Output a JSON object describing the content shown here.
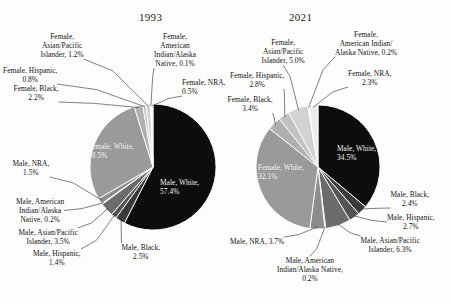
{
  "figure": {
    "background": "#fdfdfd",
    "text_color": "#141414"
  },
  "charts": [
    {
      "id": "chart-1993",
      "title": "1993",
      "center": {
        "x": 153,
        "y": 167
      },
      "radius": 63,
      "chart_data": {
        "type": "pie",
        "title": "1993",
        "start_angle_deg": -90,
        "direction": "clockwise",
        "categories": [
          "Male, White",
          "Male, Black",
          "Male, Hispanic",
          "Male, Asian/Pacific Islander",
          "Male, American Indian/Alaska Native",
          "Male, NRA",
          "Female, White",
          "Female, Black",
          "Female, Hispanic",
          "Female, Asian/Pacific Islander",
          "Female, American Indian/Alaska Native",
          "Female, NRA"
        ],
        "values": [
          57.4,
          2.5,
          1.4,
          3.5,
          0.2,
          1.5,
          28.5,
          2.2,
          0.8,
          1.2,
          0.1,
          0.5
        ],
        "unit": "%",
        "colors": [
          "#0d0d0d",
          "#3a3a3a",
          "#545454",
          "#6b6b6b",
          "#7e7e7e",
          "#8c8c8c",
          "#9a9a9a",
          "#b0b0b0",
          "#c2c2c2",
          "#d2d2d2",
          "#dedede",
          "#ececec"
        ]
      },
      "labels": [
        {
          "name": "male-white",
          "text": "Male, White,\n57.4%",
          "x": 160,
          "y": 178,
          "align": "left",
          "inside": true
        },
        {
          "name": "female-white",
          "text": "Female, White,\n28.5%",
          "x": 88,
          "y": 142,
          "align": "left",
          "inside": true
        },
        {
          "name": "female-asian-pacific-islander",
          "text": "Female,\nAsian/Pacific\nIslander, 1.2%",
          "x": 62,
          "y": 32,
          "align": "center",
          "inside": false
        },
        {
          "name": "female-american-indian-alaska-native",
          "text": "Female,\nAmerican\nIndian/Alaska\nNative, 0.1%",
          "x": 175,
          "y": 32,
          "align": "center",
          "inside": false
        },
        {
          "name": "female-nra",
          "text": "Female, NRA,\n0.5%",
          "x": 182,
          "y": 78,
          "align": "left",
          "inside": false
        },
        {
          "name": "female-hispanic",
          "text": "Female, Hispanic,\n0.8%",
          "x": 30,
          "y": 66,
          "align": "center",
          "inside": false
        },
        {
          "name": "female-black",
          "text": "Female, Black,\n2.2%",
          "x": 36,
          "y": 84,
          "align": "center",
          "inside": false
        },
        {
          "name": "male-nra",
          "text": "Male, NRA,\n1.5%",
          "x": 31,
          "y": 159,
          "align": "center",
          "inside": false
        },
        {
          "name": "male-american-indian-alaska-native",
          "text": "Male, American\nIndian/Alaska\nNative, 0.2%",
          "x": 40,
          "y": 197,
          "align": "center",
          "inside": false
        },
        {
          "name": "male-asian-pacific-islander",
          "text": "Male, Asian/Pacific\nIslander, 3.5%",
          "x": 48,
          "y": 228,
          "align": "center",
          "inside": false
        },
        {
          "name": "male-hispanic",
          "text": "Male, Hispanic,\n1.4%",
          "x": 57,
          "y": 249,
          "align": "center",
          "inside": false
        },
        {
          "name": "male-black",
          "text": "Male, Black,\n2.5%",
          "x": 141,
          "y": 243,
          "align": "center",
          "inside": false
        }
      ]
    },
    {
      "id": "chart-2021",
      "title": "2021",
      "center": {
        "x": 318,
        "y": 167
      },
      "radius": 62,
      "chart_data": {
        "type": "pie",
        "title": "2021",
        "start_angle_deg": -90,
        "direction": "clockwise",
        "categories": [
          "Male, White",
          "Male, Black",
          "Male, Hispanic",
          "Male, Asian/Pacific Islander",
          "Male, American Indian/Alaska Native",
          "Male, NRA",
          "Female, White",
          "Female, Black",
          "Female, Hispanic",
          "Female, Asian/Pacific Islander",
          "Female, American Indian/Alaska Native",
          "Female, NRA"
        ],
        "values": [
          34.5,
          2.4,
          2.7,
          6.3,
          0.2,
          3.7,
          32.1,
          3.4,
          2.8,
          5.0,
          0.2,
          2.3
        ],
        "unit": "%",
        "colors": [
          "#0d0d0d",
          "#3a3a3a",
          "#545454",
          "#6b6b6b",
          "#7e7e7e",
          "#8c8c8c",
          "#9a9a9a",
          "#b0b0b0",
          "#c2c2c2",
          "#d2d2d2",
          "#dedede",
          "#ececec"
        ]
      },
      "labels": [
        {
          "name": "male-white",
          "text": "Male, White,\n34.5%",
          "x": 337,
          "y": 144,
          "align": "left",
          "inside": true
        },
        {
          "name": "female-white",
          "text": "Female, White,\n32.1%",
          "x": 258,
          "y": 163,
          "align": "left",
          "inside": true
        },
        {
          "name": "female-american-indian-alaska-native",
          "text": "Female,\nAmerican Indian/\nAlaska Native, 0.2%",
          "x": 366,
          "y": 30,
          "align": "center",
          "inside": false
        },
        {
          "name": "female-nra",
          "text": "Female, NRA,\n2.3%",
          "x": 370,
          "y": 69,
          "align": "center",
          "inside": false
        },
        {
          "name": "female-asian-pacific-islander",
          "text": "Female,\nAsian/Pacific\nIslander, 5.0%",
          "x": 283,
          "y": 38,
          "align": "center",
          "inside": false
        },
        {
          "name": "female-hispanic",
          "text": "Female, Hispanic,\n2.8%",
          "x": 257,
          "y": 71,
          "align": "center",
          "inside": false
        },
        {
          "name": "female-black",
          "text": "Female, Black,\n3.4%",
          "x": 250,
          "y": 95,
          "align": "center",
          "inside": false
        },
        {
          "name": "male-black",
          "text": "Male, Black,\n2.4%",
          "x": 410,
          "y": 190,
          "align": "center",
          "inside": false
        },
        {
          "name": "male-hispanic",
          "text": "Male, Hispanic,\n2.7%",
          "x": 411,
          "y": 213,
          "align": "center",
          "inside": false
        },
        {
          "name": "male-asian-pacific-islander",
          "text": "Male, Asian/Pacific\nIslander, 6.3%",
          "x": 390,
          "y": 236,
          "align": "center",
          "inside": false
        },
        {
          "name": "male-american-indian-alaska-native",
          "text": "Male, American\nIndian/Alaska Native,\n0.2%",
          "x": 310,
          "y": 256,
          "align": "center",
          "inside": false
        },
        {
          "name": "male-nra",
          "text": "Male, NRA, 3.7%",
          "x": 257,
          "y": 237,
          "align": "center",
          "inside": false
        }
      ]
    }
  ]
}
